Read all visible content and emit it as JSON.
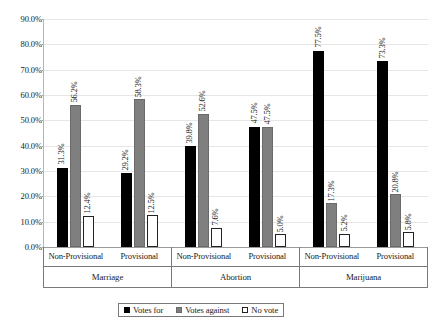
{
  "chart_data": {
    "type": "bar",
    "title": "",
    "subtitle": "",
    "xlabel": "",
    "ylabel": "",
    "ylim": [
      0,
      90
    ],
    "ytick_step": 10,
    "grid": true,
    "grid_axis": "y",
    "legend_position": "bottom-center",
    "ytick_labels": [
      "90.0%",
      "80.0%",
      "70.0%",
      "60.0%",
      "50.0%",
      "40.0%",
      "30.0%",
      "20.0%",
      "10.0%",
      "0.0%"
    ],
    "ytick_values": [
      90,
      80,
      70,
      60,
      50,
      40,
      30,
      20,
      10,
      0
    ],
    "legend": [
      {
        "name": "Votes for",
        "color": "#000000",
        "style": "filled-black"
      },
      {
        "name": "Votes against",
        "color": "#7f7f7f",
        "style": "filled-gray"
      },
      {
        "name": "No vote",
        "color": "#ffffff",
        "style": "outline-white"
      }
    ],
    "series": [
      {
        "name": "Votes for",
        "values": [
          31.3,
          29.2,
          39.8,
          47.5,
          77.5,
          73.3
        ]
      },
      {
        "name": "Votes against",
        "values": [
          56.2,
          58.3,
          52.6,
          47.5,
          17.3,
          20.8
        ]
      },
      {
        "name": "No vote",
        "values": [
          12.4,
          12.5,
          7.6,
          5.0,
          5.2,
          5.8
        ]
      }
    ],
    "groups": [
      {
        "label": "Marriage",
        "subgroups": [
          {
            "label": "Non-Provisional",
            "bars": [
              {
                "series": "Votes for",
                "value": 31.3,
                "label": "31.3%"
              },
              {
                "series": "Votes against",
                "value": 56.2,
                "label": "56.2%"
              },
              {
                "series": "No vote",
                "value": 12.4,
                "label": "12.4%"
              }
            ]
          },
          {
            "label": "Provisional",
            "bars": [
              {
                "series": "Votes for",
                "value": 29.2,
                "label": "29.2%"
              },
              {
                "series": "Votes against",
                "value": 58.3,
                "label": "58.3%"
              },
              {
                "series": "No vote",
                "value": 12.5,
                "label": "12.5%"
              }
            ]
          }
        ]
      },
      {
        "label": "Abortion",
        "subgroups": [
          {
            "label": "Non-Provisional",
            "bars": [
              {
                "series": "Votes for",
                "value": 39.8,
                "label": "39.8%"
              },
              {
                "series": "Votes against",
                "value": 52.6,
                "label": "52.6%"
              },
              {
                "series": "No vote",
                "value": 7.6,
                "label": "7.6%"
              }
            ]
          },
          {
            "label": "Provisional",
            "bars": [
              {
                "series": "Votes for",
                "value": 47.5,
                "label": "47.5%"
              },
              {
                "series": "Votes against",
                "value": 47.5,
                "label": "47.5%"
              },
              {
                "series": "No vote",
                "value": 5.0,
                "label": "5.0%"
              }
            ]
          }
        ]
      },
      {
        "label": "Marijuana",
        "subgroups": [
          {
            "label": "Non-Provisional",
            "bars": [
              {
                "series": "Votes for",
                "value": 77.5,
                "label": "77.5%"
              },
              {
                "series": "Votes against",
                "value": 17.3,
                "label": "17.3%"
              },
              {
                "series": "No vote",
                "value": 5.2,
                "label": "5.2%"
              }
            ]
          },
          {
            "label": "Provisional",
            "bars": [
              {
                "series": "Votes for",
                "value": 73.3,
                "label": "73.3%"
              },
              {
                "series": "Votes against",
                "value": 20.8,
                "label": "20.8%"
              },
              {
                "series": "No vote",
                "value": 5.8,
                "label": "5.8%"
              }
            ]
          }
        ]
      }
    ]
  }
}
